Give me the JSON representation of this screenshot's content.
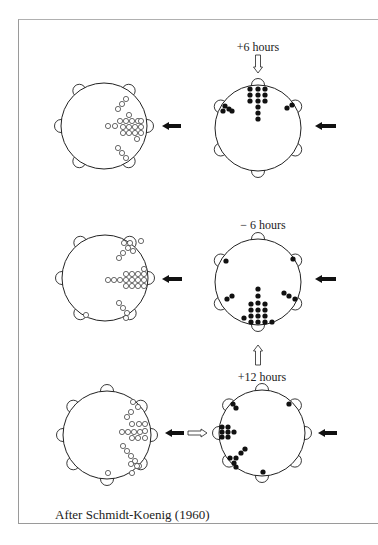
{
  "figure": {
    "caption": "After Schmidt-Koenig (1960)",
    "colors": {
      "line": "#222222",
      "filled_dot": "#111111",
      "frame": "#9a9a9a",
      "background": "#ffffff"
    }
  },
  "panels": [
    {
      "id": "row1-left",
      "cx": 104,
      "cy": 126,
      "r": 43,
      "dot_type": "open",
      "label": "",
      "bumps": [
        200,
        340,
        20,
        160,
        0,
        180
      ],
      "bump_angles_deg": [
        -125,
        -55,
        0,
        55,
        125,
        180
      ],
      "dots": [
        [
          126,
          99
        ],
        [
          122,
          104
        ],
        [
          118,
          109
        ],
        [
          129,
          115
        ],
        [
          120,
          121
        ],
        [
          126,
          121
        ],
        [
          132,
          121
        ],
        [
          138,
          121
        ],
        [
          123,
          127
        ],
        [
          129,
          127
        ],
        [
          135,
          127
        ],
        [
          141,
          121
        ],
        [
          141,
          127
        ],
        [
          108,
          126
        ],
        [
          115,
          126
        ],
        [
          123,
          133
        ],
        [
          129,
          133
        ],
        [
          135,
          133
        ],
        [
          141,
          133
        ],
        [
          137,
          139
        ],
        [
          118,
          148
        ],
        [
          122,
          153
        ],
        [
          126,
          158
        ]
      ],
      "arrows": [
        {
          "type": "solid-left",
          "x1": 181,
          "x2": 162,
          "y": 126
        }
      ]
    },
    {
      "id": "row1-right",
      "cx": 258,
      "cy": 128,
      "r": 43,
      "dot_type": "filled",
      "label": "+6 hours",
      "label_x": 258,
      "label_y": 51,
      "bump_angles_deg": [
        -90,
        -150,
        -30,
        30,
        150,
        90
      ],
      "dots": [
        [
          250,
          89
        ],
        [
          250,
          95
        ],
        [
          250,
          101
        ],
        [
          258,
          89
        ],
        [
          258,
          95
        ],
        [
          258,
          101
        ],
        [
          258,
          107
        ],
        [
          258,
          113
        ],
        [
          258,
          119
        ],
        [
          265,
          89
        ],
        [
          265,
          95
        ],
        [
          265,
          101
        ],
        [
          225,
          106
        ],
        [
          229,
          109
        ],
        [
          232,
          111
        ],
        [
          223,
          111
        ],
        [
          287,
          108
        ],
        [
          292,
          105
        ]
      ],
      "arrows": [
        {
          "type": "open-down",
          "x": 258,
          "y1": 55,
          "y2": 73
        },
        {
          "type": "solid-left",
          "x1": 336,
          "x2": 315,
          "y": 126
        }
      ]
    },
    {
      "id": "row2-left",
      "cx": 105,
      "cy": 278,
      "r": 43,
      "dot_type": "open",
      "label": "",
      "bump_angles_deg": [
        -125,
        -55,
        0,
        55,
        125,
        180
      ],
      "dots": [
        [
          124,
          243
        ],
        [
          130,
          243
        ],
        [
          128,
          248
        ],
        [
          133,
          251
        ],
        [
          123,
          253
        ],
        [
          119,
          258
        ],
        [
          141,
          241
        ],
        [
          108,
          280
        ],
        [
          114,
          280
        ],
        [
          120,
          280
        ],
        [
          126,
          274
        ],
        [
          132,
          274
        ],
        [
          138,
          274
        ],
        [
          144,
          269
        ],
        [
          126,
          280
        ],
        [
          132,
          280
        ],
        [
          138,
          280
        ],
        [
          144,
          280
        ],
        [
          126,
          286
        ],
        [
          132,
          286
        ],
        [
          138,
          286
        ],
        [
          144,
          286
        ],
        [
          144,
          274
        ],
        [
          119,
          303
        ],
        [
          123,
          308
        ],
        [
          127,
          313
        ],
        [
          126,
          318
        ],
        [
          86,
          315
        ]
      ],
      "arrows": [
        {
          "type": "solid-left",
          "x1": 182,
          "x2": 162,
          "y": 279
        }
      ]
    },
    {
      "id": "row2-right",
      "cx": 258,
      "cy": 282,
      "r": 43,
      "dot_type": "filled",
      "label": "− 6 hours",
      "label_x": 263,
      "label_y": 229,
      "bump_angles_deg": [
        -90,
        -150,
        -30,
        30,
        150,
        90
      ],
      "dots": [
        [
          226,
          261
        ],
        [
          293,
          259
        ],
        [
          227,
          299
        ],
        [
          232,
          296
        ],
        [
          284,
          293
        ],
        [
          289,
          296
        ],
        [
          295,
          299
        ],
        [
          258,
          289
        ],
        [
          258,
          296
        ],
        [
          258,
          303
        ],
        [
          251,
          304
        ],
        [
          265,
          304
        ],
        [
          258,
          310
        ],
        [
          251,
          310
        ],
        [
          265,
          310
        ],
        [
          258,
          316
        ],
        [
          251,
          316
        ],
        [
          265,
          316
        ],
        [
          244,
          318
        ],
        [
          251,
          322
        ],
        [
          258,
          322
        ],
        [
          265,
          322
        ],
        [
          272,
          322
        ]
      ],
      "arrows": [
        {
          "type": "open-up",
          "x": 258,
          "y1": 365,
          "y2": 345
        },
        {
          "type": "solid-left",
          "x1": 336,
          "x2": 315,
          "y": 279
        }
      ]
    },
    {
      "id": "row3-left",
      "cx": 107,
      "cy": 435,
      "r": 44,
      "dot_type": "open",
      "label": "",
      "bump_angles_deg": [
        -90,
        -140,
        -40,
        0,
        40,
        140,
        90,
        180
      ],
      "dots": [
        [
          133,
          402
        ],
        [
          138,
          407
        ],
        [
          131,
          412
        ],
        [
          127,
          417
        ],
        [
          132,
          424
        ],
        [
          139,
          424
        ],
        [
          145,
          424
        ],
        [
          122,
          432
        ],
        [
          128,
          432
        ],
        [
          134,
          432
        ],
        [
          140,
          432
        ],
        [
          145,
          431
        ],
        [
          132,
          438
        ],
        [
          138,
          438
        ],
        [
          145,
          438
        ],
        [
          123,
          446
        ],
        [
          127,
          451
        ],
        [
          131,
          456
        ],
        [
          135,
          461
        ],
        [
          139,
          466
        ],
        [
          137,
          466
        ],
        [
          132,
          473
        ],
        [
          131,
          464
        ],
        [
          108,
          473
        ]
      ],
      "arrows": [
        {
          "type": "solid-left",
          "x1": 184,
          "x2": 165,
          "y": 433
        },
        {
          "type": "open-right",
          "x1": 188,
          "x2": 207,
          "y": 433
        }
      ]
    },
    {
      "id": "row3-right",
      "cx": 262,
      "cy": 433,
      "r": 43,
      "dot_type": "filled",
      "label": "+12 hours",
      "label_x": 262,
      "label_y": 381,
      "bump_angles_deg": [
        -90,
        -140,
        -40,
        0,
        40,
        140,
        90,
        180
      ],
      "dots": [
        [
          233,
          404
        ],
        [
          236,
          408
        ],
        [
          289,
          404
        ],
        [
          222,
          427
        ],
        [
          228,
          427
        ],
        [
          222,
          432
        ],
        [
          228,
          432
        ],
        [
          234,
          432
        ],
        [
          222,
          437
        ],
        [
          228,
          437
        ],
        [
          245,
          449
        ],
        [
          241,
          453
        ],
        [
          236,
          458
        ],
        [
          230,
          458
        ],
        [
          234,
          463
        ],
        [
          236,
          467
        ],
        [
          263,
          472
        ]
      ],
      "arrows": [
        {
          "type": "solid-left",
          "x1": 337,
          "x2": 318,
          "y": 433
        }
      ]
    }
  ]
}
